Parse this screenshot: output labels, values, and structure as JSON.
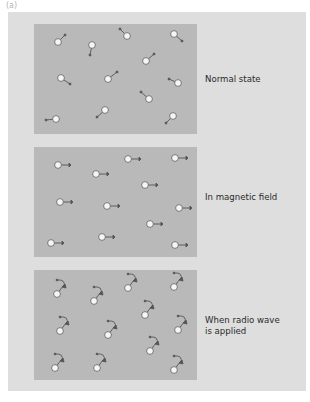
{
  "figure": {
    "label": "(a)",
    "colors": {
      "outer_background": "#dedede",
      "box_background": "#b9b9b9",
      "spin_fill": "#f5f5f5",
      "spin_stroke": "#666666",
      "arrow": "#555555"
    },
    "panels": [
      {
        "id": "normal",
        "caption_lines": [
          "Normal state"
        ],
        "spin_state": "random orientation"
      },
      {
        "id": "magnetic",
        "caption_lines": [
          "In magnetic field"
        ],
        "spin_state": "aligned to the right"
      },
      {
        "id": "radio",
        "caption_lines": [
          "When radio wave",
          "is applied"
        ],
        "spin_state": "precessing (curved arrows)"
      }
    ]
  }
}
